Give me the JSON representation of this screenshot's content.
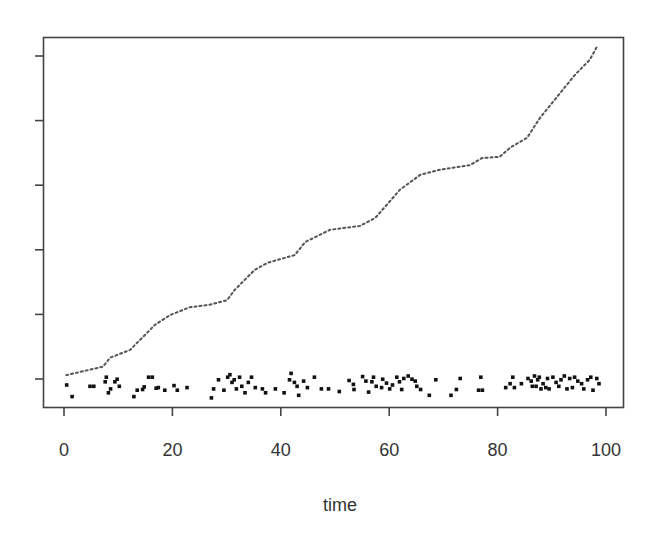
{
  "chart_data": {
    "type": "line",
    "title": "",
    "xlabel": "time",
    "ylabel": "",
    "xlim": [
      0,
      100
    ],
    "xticks": [
      0,
      20,
      40,
      60,
      80,
      100
    ],
    "xtick_labels": [
      "0",
      "20",
      "40",
      "60",
      "80",
      "100"
    ],
    "yticks_count": 6,
    "ytick_labels": [],
    "grid": false,
    "legend": null,
    "series": [
      {
        "name": "cumulative",
        "style": "dotted-line",
        "color": "#555555",
        "x": [
          0.4,
          7.2,
          8.5,
          12.2,
          16.8,
          19.6,
          23.2,
          26.9,
          30.1,
          31.5,
          35.2,
          37.6,
          42.6,
          44.5,
          49.1,
          54.6,
          57.4,
          62.0,
          65.7,
          69.4,
          74.9,
          77.1,
          80.4,
          82.3,
          85.4,
          87.8,
          91.0,
          94.3,
          97.0,
          98.3
        ],
        "y": [
          0.06,
          0.19,
          0.33,
          0.45,
          0.84,
          0.99,
          1.11,
          1.15,
          1.22,
          1.38,
          1.69,
          1.8,
          1.92,
          2.12,
          2.31,
          2.37,
          2.49,
          2.93,
          3.16,
          3.24,
          3.31,
          3.42,
          3.44,
          3.58,
          3.73,
          4.04,
          4.37,
          4.71,
          4.94,
          5.14
        ]
      },
      {
        "name": "events",
        "style": "points",
        "color": "#111111",
        "x": [
          0.5,
          1.5,
          4.8,
          5.5,
          7.6,
          7.8,
          8.2,
          8.6,
          9.4,
          9.8,
          10.2,
          12.9,
          13.5,
          14.5,
          14.8,
          15.6,
          16.3,
          17.0,
          17.4,
          18.6,
          20.3,
          20.9,
          22.7,
          27.2,
          27.6,
          28.5,
          29.5,
          30.2,
          30.6,
          31.0,
          31.4,
          31.8,
          32.4,
          32.8,
          33.4,
          34.0,
          34.6,
          35.3,
          36.6,
          37.2,
          39.0,
          40.6,
          41.6,
          41.9,
          42.5,
          43.0,
          43.3,
          44.2,
          44.9,
          46.2,
          47.5,
          48.8,
          50.8,
          52.6,
          53.4,
          53.5,
          55.1,
          55.7,
          56.2,
          56.8,
          57.1,
          57.6,
          58.6,
          58.8,
          59.5,
          60.1,
          60.6,
          61.4,
          61.9,
          62.3,
          62.7,
          63.5,
          64.2,
          64.8,
          65.1,
          65.8,
          67.4,
          68.6,
          71.4,
          72.4,
          73.1,
          76.5,
          76.9,
          77.2,
          81.5,
          82.3,
          82.8,
          83.1,
          84.4,
          85.6,
          86.2,
          86.4,
          86.8,
          87.1,
          87.4,
          87.7,
          88.0,
          88.4,
          88.9,
          89.2,
          89.5,
          90.2,
          90.8,
          91.3,
          91.7,
          92.3,
          92.8,
          93.3,
          93.8,
          94.2,
          94.8,
          95.5,
          95.9,
          96.6,
          97.2,
          97.6,
          98.3,
          98.7
        ],
        "y": [
          0.0,
          -0.18,
          -0.02,
          -0.02,
          0.05,
          0.12,
          -0.12,
          -0.06,
          0.05,
          0.09,
          -0.02,
          -0.18,
          -0.08,
          -0.07,
          -0.03,
          0.12,
          0.12,
          -0.05,
          -0.04,
          -0.08,
          -0.01,
          -0.08,
          -0.04,
          -0.2,
          -0.06,
          0.08,
          -0.08,
          0.12,
          0.16,
          0.04,
          0.08,
          -0.06,
          0.12,
          -0.02,
          -0.12,
          0.04,
          0.12,
          -0.04,
          -0.06,
          -0.12,
          -0.06,
          -0.12,
          0.08,
          0.18,
          0.04,
          -0.02,
          -0.16,
          0.06,
          -0.04,
          0.12,
          -0.06,
          -0.06,
          -0.1,
          0.07,
          0.01,
          -0.07,
          0.13,
          0.06,
          -0.11,
          0.05,
          0.12,
          -0.02,
          -0.04,
          0.09,
          0.03,
          -0.06,
          0.0,
          0.12,
          0.05,
          -0.07,
          0.1,
          0.14,
          0.09,
          0.06,
          -0.02,
          -0.07,
          -0.16,
          0.08,
          -0.16,
          -0.07,
          0.1,
          -0.08,
          0.12,
          -0.08,
          -0.04,
          0.02,
          0.12,
          -0.04,
          0.02,
          0.1,
          0.06,
          -0.02,
          0.14,
          -0.02,
          0.08,
          0.12,
          -0.06,
          0.02,
          -0.04,
          0.1,
          -0.06,
          0.12,
          0.04,
          -0.02,
          0.08,
          0.14,
          -0.06,
          0.1,
          -0.04,
          0.12,
          0.06,
          0.02,
          -0.06,
          0.08,
          0.12,
          -0.08,
          0.1,
          0.02
        ]
      }
    ]
  }
}
